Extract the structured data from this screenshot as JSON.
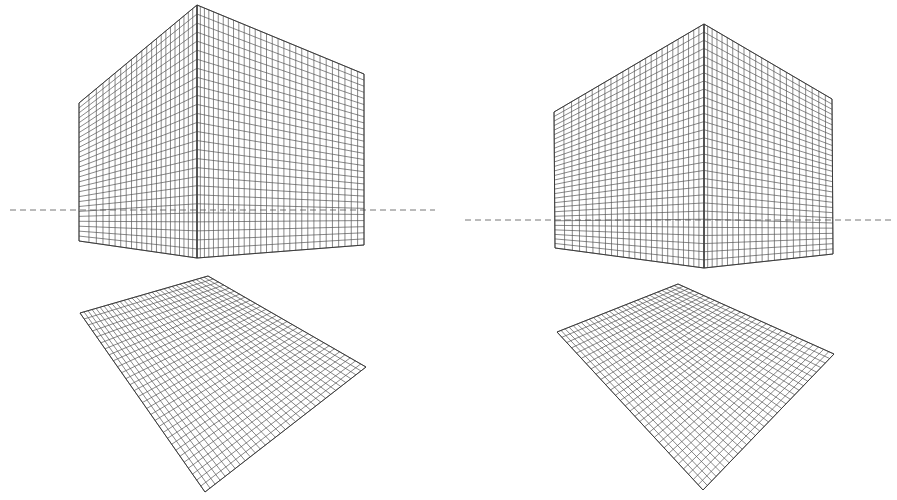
{
  "figure": {
    "colors": {
      "background": "#ffffff",
      "grid_line": "#555555",
      "outline": "#333333",
      "horizon": "#777777"
    }
  },
  "panels": [
    {
      "name": "left-panel",
      "horizon": {
        "y": 210,
        "x1": 10,
        "x2": 435
      },
      "cube": {
        "left_face": {
          "corners": [
            [
              79,
              103
            ],
            [
              197,
              5
            ],
            [
              197,
              258
            ],
            [
              79,
              241
            ]
          ],
          "cols": 22,
          "rows": 28,
          "col_bias": 0.8
        },
        "right_face": {
          "corners": [
            [
              197,
              5
            ],
            [
              364,
              74
            ],
            [
              364,
              245
            ],
            [
              197,
              258
            ]
          ],
          "cols": 30,
          "rows": 28,
          "col_bias": 1.15
        }
      },
      "floor": {
        "corners": [
          [
            208,
            276
          ],
          [
            366,
            367
          ],
          [
            205,
            492
          ],
          [
            80,
            313
          ]
        ],
        "cols": 30,
        "rows": 32
      }
    },
    {
      "name": "right-panel",
      "horizon": {
        "y": 220,
        "x1": 465,
        "x2": 893
      },
      "cube": {
        "left_face": {
          "corners": [
            [
              554,
              112
            ],
            [
              704,
              24
            ],
            [
              704,
              268
            ],
            [
              555,
              248
            ]
          ],
          "cols": 25,
          "rows": 30,
          "col_bias": 0.85
        },
        "right_face": {
          "corners": [
            [
              704,
              24
            ],
            [
              832,
              99
            ],
            [
              833,
              254
            ],
            [
              704,
              268
            ]
          ],
          "cols": 22,
          "rows": 30,
          "col_bias": 1.15
        }
      },
      "floor": {
        "corners": [
          [
            678,
            284
          ],
          [
            834,
            354
          ],
          [
            703,
            490
          ],
          [
            557,
            332
          ]
        ],
        "cols": 30,
        "rows": 30
      }
    }
  ]
}
